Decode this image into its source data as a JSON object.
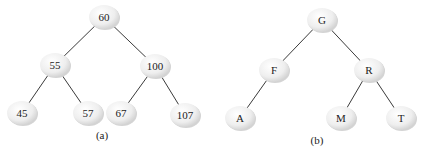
{
  "trees": [
    {
      "caption": "(a)",
      "caption_pos": [
        102,
        139
      ],
      "nodes": [
        {
          "id": "60",
          "label": "60",
          "x": 104,
          "y": 17
        },
        {
          "id": "55",
          "label": "55",
          "x": 55,
          "y": 65
        },
        {
          "id": "100",
          "label": "100",
          "x": 155,
          "y": 66
        },
        {
          "id": "45",
          "label": "45",
          "x": 22,
          "y": 113
        },
        {
          "id": "57",
          "label": "57",
          "x": 88,
          "y": 113
        },
        {
          "id": "67",
          "label": "67",
          "x": 121,
          "y": 113
        },
        {
          "id": "107",
          "label": "107",
          "x": 185,
          "y": 115
        }
      ],
      "edges": [
        [
          "60",
          "55"
        ],
        [
          "60",
          "100"
        ],
        [
          "55",
          "45"
        ],
        [
          "55",
          "57"
        ],
        [
          "100",
          "67"
        ],
        [
          "100",
          "107"
        ]
      ]
    },
    {
      "caption": "(b)",
      "caption_pos": [
        317,
        144
      ],
      "nodes": [
        {
          "id": "G",
          "label": "G",
          "x": 322,
          "y": 20
        },
        {
          "id": "F",
          "label": "F",
          "x": 274,
          "y": 70
        },
        {
          "id": "R",
          "label": "R",
          "x": 369,
          "y": 70
        },
        {
          "id": "A",
          "label": "A",
          "x": 240,
          "y": 118
        },
        {
          "id": "M",
          "label": "M",
          "x": 341,
          "y": 118
        },
        {
          "id": "T",
          "label": "T",
          "x": 401,
          "y": 118
        }
      ],
      "edges": [
        [
          "G",
          "F"
        ],
        [
          "G",
          "R"
        ],
        [
          "F",
          "A"
        ],
        [
          "R",
          "M"
        ],
        [
          "R",
          "T"
        ]
      ]
    }
  ],
  "style": {
    "node_fill": "#eeeeee",
    "node_shade": "#d4d4d4",
    "edge_color": "#3a3a3a",
    "node_rx": 15,
    "node_ry": 12
  }
}
